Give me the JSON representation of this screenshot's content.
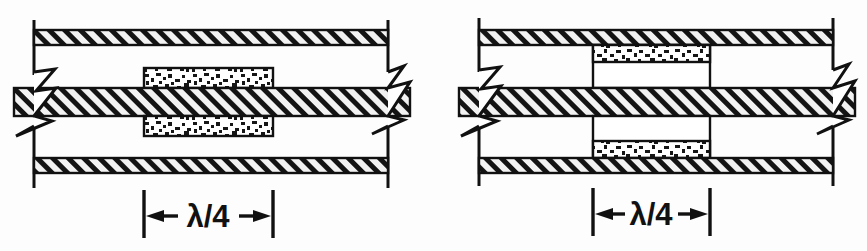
{
  "figure": {
    "background_color": "#fdfdfd",
    "line_color": "#111111",
    "hatch_fill_color": "#f2f2f2",
    "stipple_fill_color": "#ffffff",
    "panel_count": 2
  },
  "panels": [
    {
      "id": "panel-left",
      "name": "centered-dielectric-slab-configuration",
      "description": "Dielectric blocks centered on the middle conductor, away from the outer walls",
      "dimension": {
        "label": "λ/4",
        "label_plain": "lambda/4",
        "arrow_style": "double-headed-outward",
        "extension_line_left_x": 144,
        "extension_line_right_x": 273
      },
      "bars": [
        {
          "name": "top-wall",
          "hatch": "diagonal",
          "y": 30,
          "height": 15
        },
        {
          "name": "center-conductor",
          "hatch": "diagonal",
          "y": 88,
          "height": 28
        },
        {
          "name": "bottom-wall",
          "hatch": "diagonal",
          "y": 158,
          "height": 15
        }
      ],
      "dielectric_blocks": [
        {
          "name": "upper-dielectric-block",
          "texture": "stipple",
          "x": 144,
          "y": 68,
          "width": 129,
          "height": 20
        },
        {
          "name": "lower-dielectric-block",
          "texture": "stipple",
          "x": 144,
          "y": 116,
          "width": 129,
          "height": 20
        }
      ],
      "break_symbols": [
        {
          "name": "left-break-line",
          "side": "left"
        },
        {
          "name": "right-break-line",
          "side": "right"
        }
      ]
    },
    {
      "id": "panel-right",
      "name": "wall-mounted-dielectric-slab-configuration",
      "description": "Dielectric blocks placed against the outer walls, with chamber side walls drawn",
      "dimension": {
        "label": "λ/4",
        "label_plain": "lambda/4",
        "arrow_style": "double-headed-outward",
        "extension_line_left_x": 160,
        "extension_line_right_x": 277
      },
      "bars": [
        {
          "name": "top-wall",
          "hatch": "diagonal",
          "y": 30,
          "height": 15
        },
        {
          "name": "center-conductor",
          "hatch": "diagonal",
          "y": 88,
          "height": 28
        },
        {
          "name": "bottom-wall",
          "hatch": "diagonal",
          "y": 158,
          "height": 15
        }
      ],
      "dielectric_blocks": [
        {
          "name": "upper-dielectric-block",
          "texture": "stipple",
          "x": 160,
          "y": 45,
          "width": 117,
          "height": 17
        },
        {
          "name": "lower-dielectric-block",
          "texture": "stipple",
          "x": 160,
          "y": 141,
          "width": 117,
          "height": 17
        }
      ],
      "chamber_walls": [
        {
          "name": "upper-chamber-left-wall",
          "x": 160,
          "y1": 45,
          "y2": 88
        },
        {
          "name": "upper-chamber-right-wall",
          "x": 277,
          "y1": 45,
          "y2": 88
        },
        {
          "name": "lower-chamber-left-wall",
          "x": 160,
          "y1": 116,
          "y2": 158
        },
        {
          "name": "lower-chamber-right-wall",
          "x": 277,
          "y1": 116,
          "y2": 158
        }
      ],
      "break_symbols": [
        {
          "name": "left-break-line",
          "side": "left"
        },
        {
          "name": "right-break-line",
          "side": "right"
        }
      ]
    }
  ]
}
